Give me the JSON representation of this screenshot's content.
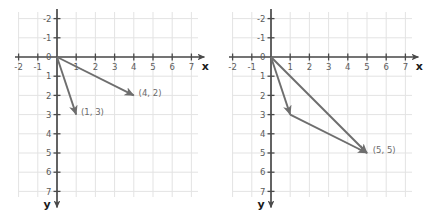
{
  "figure": {
    "type": "vector-diagram",
    "background": "#ffffff",
    "grid_color": "#e3e3e3",
    "axis_color": "#4a4a4a",
    "vector_color": "#6e6e6e",
    "label_color": "#6a6a6a",
    "tick_color": "#5b5b5b"
  },
  "geometry": {
    "unit_px": 19.2,
    "origin_x_px": 57,
    "origin_y_px": 57,
    "grid_left_px": 18,
    "grid_top_px": 12,
    "grid_right_px": 198,
    "grid_bottom_px": 197,
    "panel_offset_px": 214
  },
  "axes": {
    "x_label": "x",
    "y_label": "y",
    "x_ticks": [
      -2,
      -1,
      0,
      1,
      2,
      3,
      4,
      5,
      6,
      7
    ],
    "y_ticks": [
      -2,
      -1,
      0,
      1,
      2,
      3,
      4,
      5,
      6,
      7
    ],
    "x_tick_labels": [
      "-2",
      "-1",
      "0",
      "1",
      "2",
      "3",
      "4",
      "5",
      "6",
      "7"
    ],
    "y_tick_labels": [
      "-2",
      "-1",
      "0",
      "1",
      "2",
      "3",
      "4",
      "5",
      "6",
      "7"
    ],
    "y_axis_direction": "down-positive",
    "x_axis_direction": "right-positive",
    "x_arrow": true,
    "y_arrow": true
  },
  "panels": [
    {
      "id": "left",
      "name": "component-vectors",
      "vectors": [
        {
          "name": "vector-a",
          "from": [
            0,
            0
          ],
          "to": [
            1,
            3
          ],
          "label": "(1, 3)",
          "label_at": [
            1.25,
            2.85
          ],
          "arrowhead": true
        },
        {
          "name": "vector-b",
          "from": [
            0,
            0
          ],
          "to": [
            4,
            2
          ],
          "label": "(4, 2)",
          "label_at": [
            4.25,
            1.85
          ],
          "arrowhead": true
        }
      ]
    },
    {
      "id": "right",
      "name": "resultant-vector",
      "vectors": [
        {
          "name": "vector-a",
          "from": [
            0,
            0
          ],
          "to": [
            1,
            3
          ],
          "label": "",
          "label_at": null,
          "arrowhead": true
        },
        {
          "name": "vector-b-translated",
          "from": [
            1,
            3
          ],
          "to": [
            5,
            5
          ],
          "label": "",
          "label_at": null,
          "arrowhead": true
        },
        {
          "name": "vector-resultant",
          "from": [
            0,
            0
          ],
          "to": [
            5,
            5
          ],
          "label": "(5, 5)",
          "label_at": [
            5.3,
            4.85
          ],
          "arrowhead": true
        }
      ]
    }
  ]
}
